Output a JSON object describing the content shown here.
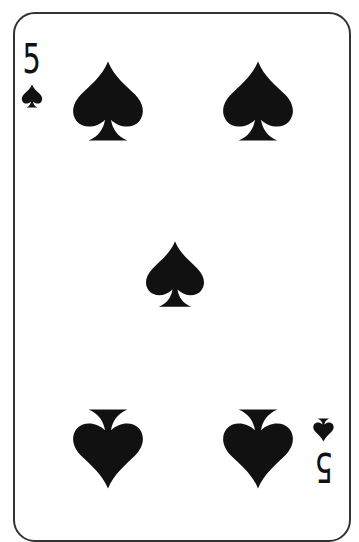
{
  "card": {
    "rank": "5",
    "suit": "spades",
    "suit_icon": "spade-icon",
    "ink_color": "#111111",
    "border_color": "#333333",
    "background_color": "#ffffff",
    "pip_count": 5
  },
  "corners": {
    "top_left": {
      "rank": "5",
      "suit_icon": "spade-icon"
    },
    "bottom_right": {
      "rank": "5",
      "suit_icon": "spade-icon",
      "rotated": true
    }
  },
  "pips": [
    {
      "position": "top-left",
      "inverted": false
    },
    {
      "position": "top-right",
      "inverted": false
    },
    {
      "position": "center",
      "inverted": false
    },
    {
      "position": "bottom-left",
      "inverted": true
    },
    {
      "position": "bottom-right",
      "inverted": true
    }
  ]
}
